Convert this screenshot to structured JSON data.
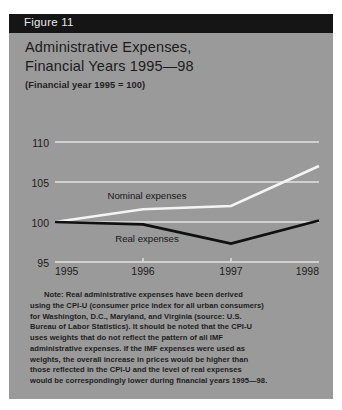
{
  "figure": {
    "number_label": "Figure 11",
    "title_line1": "Administrative Expenses,",
    "title_line2": "Financial Years 1995—98",
    "subtitle": "(Financial year 1995 = 100)"
  },
  "colors": {
    "panel_background": "#9a9a9a",
    "header_bar": "#151515",
    "header_text": "#e8e8e8",
    "title_text": "#1b1b1b",
    "gridline": "#e2e2e2",
    "nominal_line": "#f4f4f4",
    "real_line": "#101010",
    "note_text": "#1d1d1d",
    "page_background": "#ffffff"
  },
  "chart_data": {
    "type": "line",
    "title": "Administrative Expenses, Financial Years 1995—98",
    "subtitle": "(Financial year 1995 = 100)",
    "xlabel": "",
    "ylabel": "",
    "x": [
      "1995",
      "1996",
      "1997",
      "1998"
    ],
    "xtick_labels": [
      "1995",
      "1996",
      "1997",
      "1998"
    ],
    "ytick_labels": [
      "110",
      "105",
      "100",
      "95"
    ],
    "yticks": [
      110,
      105,
      100,
      95
    ],
    "ylim": [
      95,
      111.5
    ],
    "grid": true,
    "legend": "inline-annotation",
    "series": [
      {
        "name": "Nominal expenses",
        "color": "#f4f4f4",
        "label_position": "above-line",
        "values": [
          100.0,
          101.6,
          102.0,
          107.0
        ]
      },
      {
        "name": "Real expenses",
        "color": "#101010",
        "label_position": "below-line",
        "values": [
          100.0,
          99.7,
          97.3,
          100.2
        ]
      }
    ],
    "annotations": [
      {
        "text": "Nominal expenses",
        "x": "1996",
        "y": 103.3
      },
      {
        "text": "Real expenses",
        "x": "1996",
        "y": 98.0
      }
    ]
  },
  "note": {
    "lines": [
      "Note:  Real administrative expenses have been derived",
      "using the CPI-U (consumer price index for all urban consumers)",
      "for Washington, D.C., Maryland, and Virginia (source: U.S.",
      "Bureau of Labor Statistics). It should be noted that the CPI-U",
      "uses weights that do not reflect the pattern of all IMF",
      "administrative expenses. If the IMF expenses were used as",
      "weights, the overall increase in prices would be higher than",
      "those reflected in the CPI-U and the level of real expenses",
      "would be correspondingly lower during financial years 1995—98."
    ]
  }
}
